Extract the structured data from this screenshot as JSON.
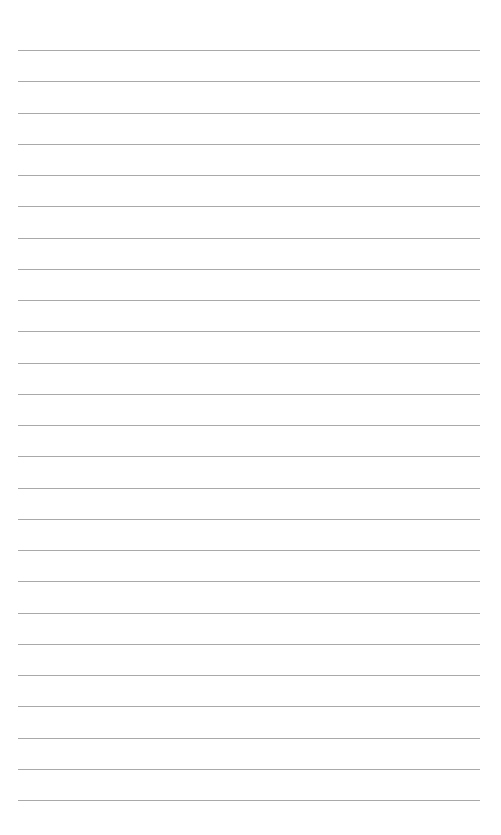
{
  "page": {
    "type": "lined-paper",
    "line_count": 25,
    "first_line_y": 50,
    "line_spacing": 31.25,
    "line_left": 18,
    "line_right": 480,
    "line_color": "#8c8c8c",
    "background": "#ffffff"
  }
}
